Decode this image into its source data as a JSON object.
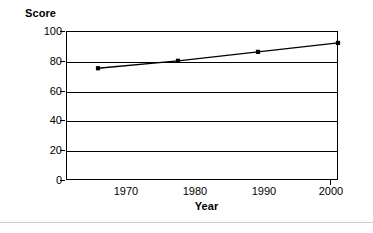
{
  "chart_data": {
    "type": "line",
    "title": "",
    "xlabel": "Year",
    "ylabel": "Score",
    "x": [
      1970,
      1980,
      1990,
      2000
    ],
    "xtick_labels": [
      "1970",
      "1980",
      "1990",
      "2000"
    ],
    "ytick_labels": [
      "0",
      "20",
      "40",
      "60",
      "80",
      "100"
    ],
    "yticks": [
      0,
      20,
      40,
      60,
      80,
      100
    ],
    "values": [
      75,
      80,
      86,
      92
    ],
    "series": [
      {
        "name": "Score",
        "values": [
          75,
          80,
          86,
          92
        ]
      }
    ],
    "xlim": [
      1966,
      2000
    ],
    "ylim": [
      0,
      100
    ],
    "grid": "horizontal",
    "legend": "none",
    "marker": "filled-square",
    "line_color": "#000000",
    "marker_color": "#000000",
    "background_color": "#ffffff",
    "axis_color": "#000000"
  }
}
